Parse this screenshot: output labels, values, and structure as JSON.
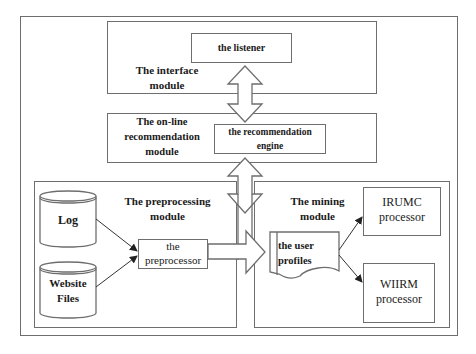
{
  "diagram": {
    "modules": {
      "interface": {
        "label": "The interface\nmodule"
      },
      "online": {
        "label": "The on-line\nrecommendation\nmodule"
      },
      "preprocessing": {
        "label": "The preprocessing\nmodule"
      },
      "mining": {
        "label": "The mining\nmodule"
      }
    },
    "nodes": {
      "listener": "the listener",
      "engine": "the recommendation\nengine",
      "log": "Log",
      "website_files": "Website\nFiles",
      "preprocessor": "the\npreprocessor",
      "user_profiles": "the user\nprofiles",
      "irumc": "IRUMC\nprocessor",
      "wiirm": "WIIRM\nprocessor"
    },
    "edges": [
      {
        "from": "listener",
        "to": "engine",
        "type": "double-block-arrow"
      },
      {
        "from": "engine",
        "to": "mining/preprocessing",
        "type": "double-block-arrow"
      },
      {
        "from": "log",
        "to": "preprocessor",
        "type": "arrow"
      },
      {
        "from": "website_files",
        "to": "preprocessor",
        "type": "arrow"
      },
      {
        "from": "preprocessor",
        "to": "user_profiles",
        "type": "block-arrow"
      },
      {
        "from": "user_profiles",
        "to": "irumc",
        "type": "arrow"
      },
      {
        "from": "user_profiles",
        "to": "wiirm",
        "type": "arrow"
      }
    ],
    "colors": {
      "stroke": "#6e6e6e",
      "text": "#1a1a1a",
      "background": "#ffffff"
    }
  }
}
